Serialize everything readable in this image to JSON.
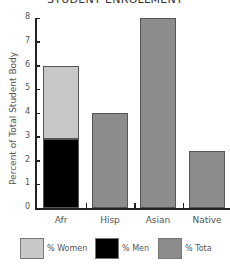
{
  "chart_data": {
    "type": "bar",
    "title": "STUDENT ENROLLMENT",
    "xlabel": "",
    "ylabel": "Percent of Total Student Body",
    "ylim": [
      0,
      8
    ],
    "yticks": [
      0,
      1,
      2,
      3,
      4,
      5,
      6,
      7,
      8
    ],
    "grid": false,
    "legend_position": "bottom",
    "categories": [
      "Afr",
      "Hisp",
      "Asian",
      "Native"
    ],
    "series": [
      {
        "name": "% Women",
        "color": "#c8c8c8",
        "values": [
          3.1,
          null,
          null,
          null
        ]
      },
      {
        "name": "% Men",
        "color": "#000000",
        "values": [
          2.9,
          null,
          null,
          null
        ]
      },
      {
        "name": "% Total",
        "color": "#8c8c8c",
        "values": [
          null,
          4.0,
          8.0,
          2.4
        ]
      }
    ],
    "stacked_totals": [
      6.0,
      4.0,
      8.0,
      2.4
    ],
    "legend": [
      "% Women",
      "% Men",
      "% Tota"
    ]
  },
  "title": "STUDENT ENROLLMENT",
  "ylabel": "Percent of Total Student Body",
  "yticks": [
    "0",
    "1",
    "2",
    "3",
    "4",
    "5",
    "6",
    "7",
    "8"
  ],
  "categories": [
    "Afr",
    "Hisp",
    "Asian",
    "Native"
  ],
  "legend": {
    "women": "% Women",
    "men": "% Men",
    "total": "% Tota"
  }
}
